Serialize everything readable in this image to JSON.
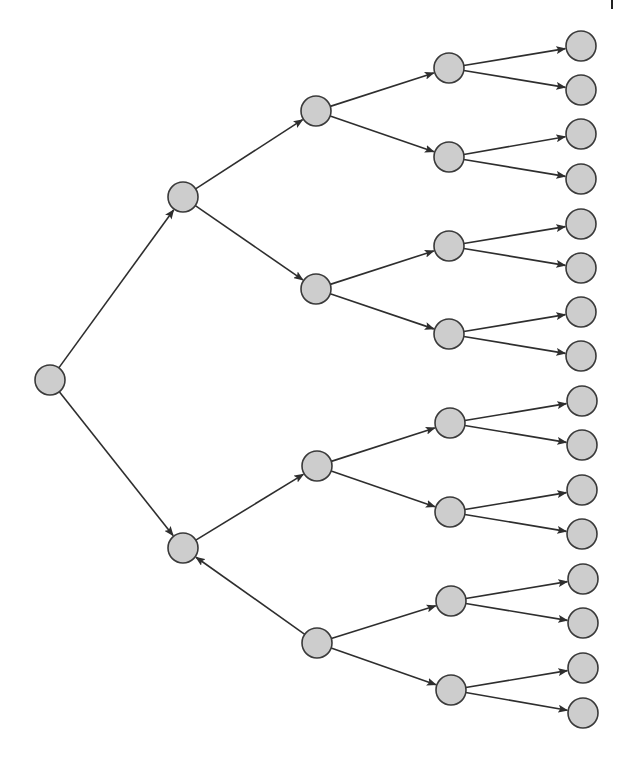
{
  "diagram": {
    "type": "binary-tree",
    "orientation": "left-to-right",
    "depth": 4,
    "colors": {
      "node_fill": "#cdcdcd",
      "node_stroke": "#3a3a3a",
      "edge": "#2e2e2e",
      "background": "#ffffff"
    },
    "node_radius": 15,
    "nodes": [
      {
        "id": "n0",
        "level": 0,
        "x": 50,
        "y": 380
      },
      {
        "id": "n1",
        "level": 1,
        "x": 183,
        "y": 197
      },
      {
        "id": "n2",
        "level": 1,
        "x": 183,
        "y": 548
      },
      {
        "id": "n3",
        "level": 2,
        "x": 316,
        "y": 111
      },
      {
        "id": "n4",
        "level": 2,
        "x": 316,
        "y": 289
      },
      {
        "id": "n5",
        "level": 2,
        "x": 317,
        "y": 466
      },
      {
        "id": "n6",
        "level": 2,
        "x": 317,
        "y": 643
      },
      {
        "id": "n7",
        "level": 3,
        "x": 449,
        "y": 68
      },
      {
        "id": "n8",
        "level": 3,
        "x": 449,
        "y": 157
      },
      {
        "id": "n9",
        "level": 3,
        "x": 449,
        "y": 246
      },
      {
        "id": "n10",
        "level": 3,
        "x": 449,
        "y": 334
      },
      {
        "id": "n11",
        "level": 3,
        "x": 450,
        "y": 423
      },
      {
        "id": "n12",
        "level": 3,
        "x": 450,
        "y": 512
      },
      {
        "id": "n13",
        "level": 3,
        "x": 451,
        "y": 601
      },
      {
        "id": "n14",
        "level": 3,
        "x": 451,
        "y": 690
      },
      {
        "id": "n15",
        "level": 4,
        "x": 581,
        "y": 46
      },
      {
        "id": "n16",
        "level": 4,
        "x": 581,
        "y": 90
      },
      {
        "id": "n17",
        "level": 4,
        "x": 581,
        "y": 134
      },
      {
        "id": "n18",
        "level": 4,
        "x": 581,
        "y": 179
      },
      {
        "id": "n19",
        "level": 4,
        "x": 581,
        "y": 224
      },
      {
        "id": "n20",
        "level": 4,
        "x": 581,
        "y": 268
      },
      {
        "id": "n21",
        "level": 4,
        "x": 581,
        "y": 312
      },
      {
        "id": "n22",
        "level": 4,
        "x": 581,
        "y": 356
      },
      {
        "id": "n23",
        "level": 4,
        "x": 582,
        "y": 401
      },
      {
        "id": "n24",
        "level": 4,
        "x": 582,
        "y": 445
      },
      {
        "id": "n25",
        "level": 4,
        "x": 582,
        "y": 490
      },
      {
        "id": "n26",
        "level": 4,
        "x": 582,
        "y": 534
      },
      {
        "id": "n27",
        "level": 4,
        "x": 583,
        "y": 579
      },
      {
        "id": "n28",
        "level": 4,
        "x": 583,
        "y": 623
      },
      {
        "id": "n29",
        "level": 4,
        "x": 583,
        "y": 668
      },
      {
        "id": "n30",
        "level": 4,
        "x": 583,
        "y": 713
      }
    ],
    "edges": [
      {
        "from": "n0",
        "to": "n1"
      },
      {
        "from": "n0",
        "to": "n2"
      },
      {
        "from": "n1",
        "to": "n3"
      },
      {
        "from": "n1",
        "to": "n4"
      },
      {
        "from": "n2",
        "to": "n5"
      },
      {
        "from": "n6",
        "to": "n2",
        "note": "reversed arrow (points back to parent)"
      },
      {
        "from": "n3",
        "to": "n7"
      },
      {
        "from": "n3",
        "to": "n8"
      },
      {
        "from": "n4",
        "to": "n9"
      },
      {
        "from": "n4",
        "to": "n10"
      },
      {
        "from": "n5",
        "to": "n11"
      },
      {
        "from": "n5",
        "to": "n12"
      },
      {
        "from": "n6",
        "to": "n13"
      },
      {
        "from": "n6",
        "to": "n14"
      },
      {
        "from": "n7",
        "to": "n15"
      },
      {
        "from": "n7",
        "to": "n16"
      },
      {
        "from": "n8",
        "to": "n17"
      },
      {
        "from": "n8",
        "to": "n18"
      },
      {
        "from": "n9",
        "to": "n19"
      },
      {
        "from": "n9",
        "to": "n20"
      },
      {
        "from": "n10",
        "to": "n21"
      },
      {
        "from": "n10",
        "to": "n22"
      },
      {
        "from": "n11",
        "to": "n23"
      },
      {
        "from": "n11",
        "to": "n24"
      },
      {
        "from": "n12",
        "to": "n25"
      },
      {
        "from": "n12",
        "to": "n26"
      },
      {
        "from": "n13",
        "to": "n27"
      },
      {
        "from": "n13",
        "to": "n28"
      },
      {
        "from": "n14",
        "to": "n29"
      },
      {
        "from": "n14",
        "to": "n30"
      }
    ]
  }
}
